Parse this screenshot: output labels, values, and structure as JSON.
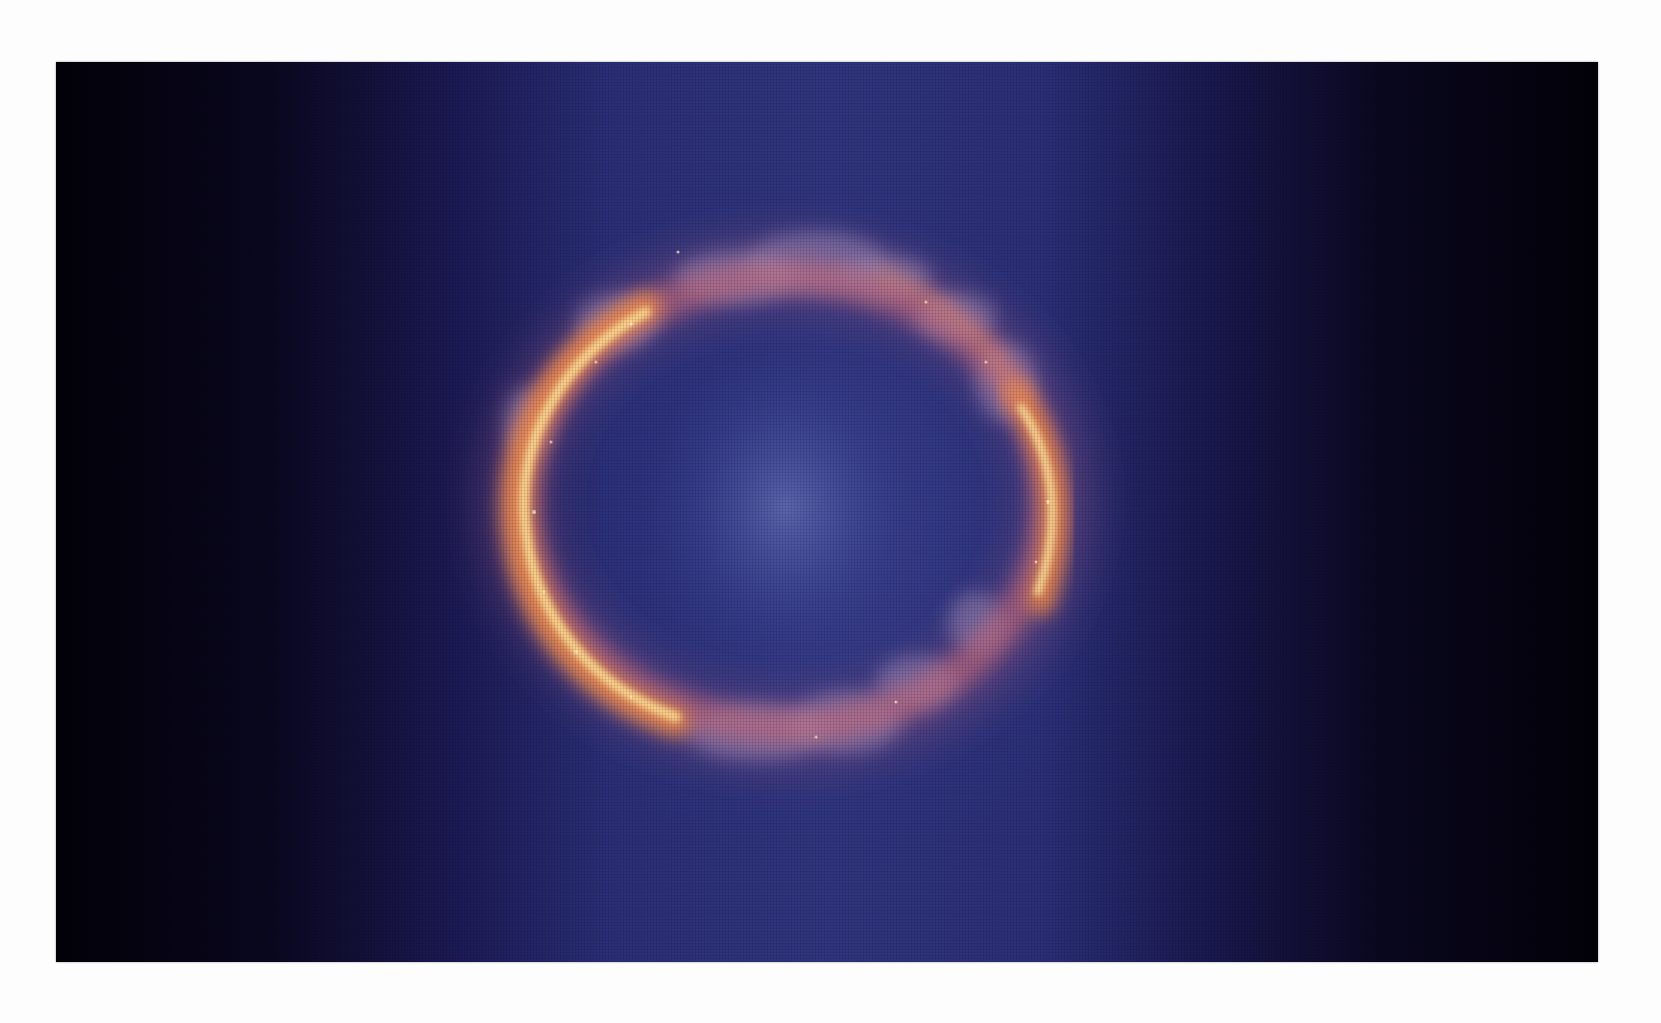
{
  "image": {
    "subject": "Einstein ring (gravitational lens) photograph",
    "alt": "Glowing orange-pink ring of lensed light surrounding a faint bluish central glow on a deep blue-to-black background",
    "colors": {
      "page_background": "#fdfdfd",
      "edge_dark": "#020108",
      "deep_blue": "#1c1a55",
      "mid_blue": "#30357f",
      "center_glow": "#5a66b0",
      "ring_hot": "#ffe0a0",
      "ring_orange": "#f08a4a",
      "ring_pink": "#c86a8a",
      "cloud_lilac": "#9a84b0"
    }
  }
}
